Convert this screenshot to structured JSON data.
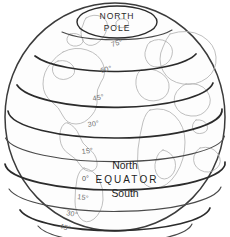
{
  "figure": {
    "name": "globe-latitude-diagram",
    "type": "line-diagram"
  },
  "colors": {
    "background": "#ffffff",
    "outline": "#3b3b3b",
    "parallel_major": "#2b2b2b",
    "parallel_minor": "#4a4a4a",
    "coastline": "#b4b4b4",
    "label_text": "#1d1d1d",
    "tick_label": "#6d6d6d"
  },
  "pole": {
    "line1": "NORTH",
    "line2": "POLE"
  },
  "equator": {
    "zero_label": "0°",
    "north_label": "North",
    "title": "EQUATOR",
    "south_label": "South"
  },
  "latitudes": {
    "north": [
      {
        "label": "75°",
        "value": 75,
        "hemisphere": "north"
      },
      {
        "label": "60°",
        "value": 60,
        "hemisphere": "north"
      },
      {
        "label": "45°",
        "value": 45,
        "hemisphere": "north"
      },
      {
        "label": "30°",
        "value": 30,
        "hemisphere": "north"
      },
      {
        "label": "15°",
        "value": 15,
        "hemisphere": "north"
      }
    ],
    "south": [
      {
        "label": "15°",
        "value": -15,
        "hemisphere": "south"
      },
      {
        "label": "30°",
        "value": -30,
        "hemisphere": "south"
      },
      {
        "label": "45°",
        "value": -45,
        "hemisphere": "south"
      }
    ]
  }
}
